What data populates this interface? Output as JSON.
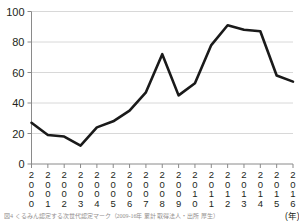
{
  "chart_data": {
    "type": "line",
    "title": "",
    "xlabel": "(年)",
    "ylabel": "",
    "ylim": [
      0,
      100
    ],
    "yticks": [
      0,
      20,
      40,
      60,
      80,
      100
    ],
    "grid": true,
    "legend": "none",
    "categories": [
      "2000",
      "2001",
      "2002",
      "2003",
      "2004",
      "2005",
      "2006",
      "2007",
      "2008",
      "2009",
      "2010",
      "2011",
      "2012",
      "2013",
      "2014",
      "2015",
      "2016"
    ],
    "values": [
      27,
      19,
      18,
      12,
      24,
      28,
      35,
      47,
      72,
      45,
      53,
      78,
      91,
      88,
      87,
      58,
      54
    ],
    "series": [
      {
        "name": "",
        "values": [
          27,
          19,
          18,
          12,
          24,
          28,
          35,
          47,
          72,
          45,
          53,
          78,
          91,
          88,
          87,
          58,
          54
        ],
        "color": "#1a1a1a"
      }
    ],
    "line_color": "#1a1a1a",
    "grid_color": "#d8d8d8",
    "axis_color": "#8a8a8a",
    "text_color": "#231f20"
  },
  "axes": {
    "y_tick_labels": [
      "100",
      "80",
      "60",
      "40",
      "20",
      "0"
    ],
    "x_tick_labels": [
      "2000",
      "2001",
      "2002",
      "2003",
      "2004",
      "2005",
      "2006",
      "2007",
      "2008",
      "2009",
      "2010",
      "2011",
      "2012",
      "2013",
      "2014",
      "2015",
      "2016"
    ],
    "x_unit_label": "(年)"
  },
  "caption": {
    "text": "図4 くるみん認定する次世代認定マーク（2009-16年 累計 取得法人・出所 厚生）"
  }
}
